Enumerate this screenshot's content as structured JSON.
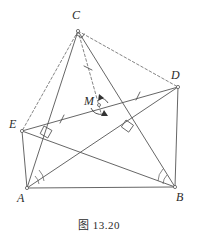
{
  "figure": {
    "caption": "图 13.20",
    "stroke_color": "#555555",
    "dash_color": "#666666",
    "label_color": "#2b2b2b",
    "background": "#ffffff",
    "width": 198,
    "height": 243
  },
  "points": [
    {
      "name": "A",
      "label": "A",
      "x": 27,
      "y": 188,
      "label_x": 17,
      "label_y": 192
    },
    {
      "name": "B",
      "label": "B",
      "x": 175,
      "y": 187,
      "label_x": 176,
      "label_y": 191
    },
    {
      "name": "C",
      "label": "C",
      "x": 78,
      "y": 31,
      "label_x": 72,
      "label_y": 9
    },
    {
      "name": "D",
      "label": "D",
      "x": 178,
      "y": 87,
      "label_x": 171,
      "label_y": 69
    },
    {
      "name": "E",
      "label": "E",
      "x": 22,
      "y": 131,
      "label_x": 9,
      "label_y": 118
    },
    {
      "name": "M",
      "label": "M",
      "x": 99,
      "y": 105,
      "label_x": 84,
      "label_y": 95
    }
  ],
  "solid_segments": [
    {
      "name": "segment-AB",
      "from": "A",
      "to": "B"
    },
    {
      "name": "segment-AC",
      "from": "A",
      "to": "C"
    },
    {
      "name": "segment-BC",
      "from": "B",
      "to": "C"
    },
    {
      "name": "segment-AD",
      "from": "A",
      "to": "D"
    },
    {
      "name": "segment-BE",
      "from": "B",
      "to": "E"
    },
    {
      "name": "segment-ED",
      "from": "E",
      "to": "D"
    },
    {
      "name": "segment-AE",
      "from": "A",
      "to": "E"
    },
    {
      "name": "segment-BD",
      "from": "B",
      "to": "D"
    }
  ],
  "dashed_segments": [
    {
      "name": "segment-CE-dashed",
      "from": "C",
      "to": "E"
    },
    {
      "name": "segment-CD-dashed",
      "from": "C",
      "to": "D"
    },
    {
      "name": "segment-CM-dashed",
      "from": "C",
      "to": "M"
    }
  ],
  "tick_marks": [
    {
      "name": "tick-EM",
      "x": 62,
      "y": 119,
      "angle": 18
    },
    {
      "name": "tick-MD",
      "x": 138,
      "y": 96,
      "angle": 18
    },
    {
      "name": "tick-CM",
      "x": 88,
      "y": 68,
      "angle": 72
    }
  ],
  "right_angle_marks": [
    {
      "name": "right-angle-at-C",
      "x": 78,
      "y": 31,
      "rotation": 20
    },
    {
      "name": "right-angle-near-E",
      "x": 48,
      "y": 130,
      "rotation": 20
    },
    {
      "name": "right-angle-near-D",
      "x": 130,
      "y": 124,
      "rotation": 22
    }
  ],
  "angle_arcs": [
    {
      "name": "angle-arc-at-A",
      "x": 27,
      "y": 188
    },
    {
      "name": "angle-arc-at-B",
      "x": 175,
      "y": 187
    }
  ],
  "rotation_arrows": [
    {
      "name": "rotation-arrow-upper",
      "x": 101,
      "y": 98
    },
    {
      "name": "rotation-arrow-lower",
      "x": 101,
      "y": 112
    }
  ]
}
